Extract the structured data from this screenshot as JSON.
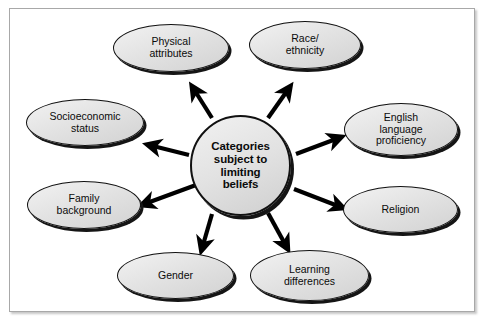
{
  "diagram": {
    "title": "Categories subject to limiting beliefs",
    "type": "hub-and-spoke",
    "center": {
      "id": "center-node",
      "label": "Categories subject to limiting beliefs",
      "lines": [
        "Categories",
        "subject to",
        "limiting",
        "beliefs"
      ],
      "shape": "circle",
      "fill": "#e4e4e4",
      "stroke": "#111111"
    },
    "nodes": [
      {
        "id": "physical-attributes",
        "label": "Physical attributes",
        "lines": [
          "Physical",
          "attributes"
        ],
        "shape": "ellipse",
        "position": "top-left"
      },
      {
        "id": "race-ethnicity",
        "label": "Race/ ethnicity",
        "lines": [
          "Race/",
          "ethnicity"
        ],
        "shape": "ellipse",
        "position": "top-right"
      },
      {
        "id": "socioeconomic-status",
        "label": "Socioeconomic status",
        "lines": [
          "Socioeconomic",
          "status"
        ],
        "shape": "ellipse",
        "position": "left-upper"
      },
      {
        "id": "english-language-proficiency",
        "label": "English language proficiency",
        "lines": [
          "English",
          "language",
          "proficiency"
        ],
        "shape": "ellipse",
        "position": "right-upper"
      },
      {
        "id": "family-background",
        "label": "Family background",
        "lines": [
          "Family",
          "background"
        ],
        "shape": "ellipse",
        "position": "left-lower"
      },
      {
        "id": "religion",
        "label": "Religion",
        "lines": [
          "Religion"
        ],
        "shape": "ellipse",
        "position": "right-lower"
      },
      {
        "id": "gender",
        "label": "Gender",
        "lines": [
          "Gender"
        ],
        "shape": "ellipse",
        "position": "bottom-left"
      },
      {
        "id": "learning-differences",
        "label": "Learning differences",
        "lines": [
          "Learning",
          "differences"
        ],
        "shape": "ellipse",
        "position": "bottom-right"
      }
    ],
    "arrows": [
      {
        "id": "arrow-to-physical-attributes",
        "from": "center-node",
        "to": "physical-attributes",
        "direction": "outward"
      },
      {
        "id": "arrow-to-race-ethnicity",
        "from": "center-node",
        "to": "race-ethnicity",
        "direction": "outward"
      },
      {
        "id": "arrow-to-socioeconomic-status",
        "from": "center-node",
        "to": "socioeconomic-status",
        "direction": "outward"
      },
      {
        "id": "arrow-to-english-language-proficiency",
        "from": "center-node",
        "to": "english-language-proficiency",
        "direction": "outward"
      },
      {
        "id": "arrow-to-family-background",
        "from": "center-node",
        "to": "family-background",
        "direction": "outward"
      },
      {
        "id": "arrow-to-religion",
        "from": "center-node",
        "to": "religion",
        "direction": "outward"
      },
      {
        "id": "arrow-to-gender",
        "from": "center-node",
        "to": "gender",
        "direction": "outward"
      },
      {
        "id": "arrow-to-learning-differences",
        "from": "center-node",
        "to": "learning-differences",
        "direction": "outward"
      }
    ],
    "colors": {
      "node_fill": "#e4e4e4",
      "node_stroke": "#111111",
      "arrow": "#000000",
      "frame_border": "#a8a8a8",
      "background": "#ffffff",
      "text": "#0b0b0b"
    }
  }
}
